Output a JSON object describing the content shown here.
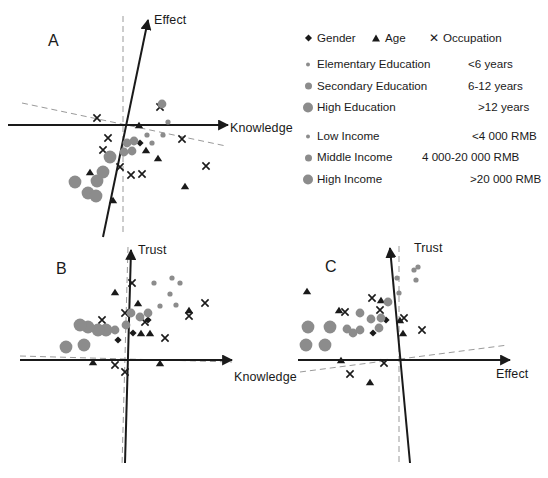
{
  "figure": {
    "type": "multi-panel-biplot",
    "panels": [
      "A",
      "B",
      "C"
    ]
  },
  "legend": {
    "rows": [
      {
        "marker": "diamond",
        "label": "Gender",
        "value": ""
      },
      {
        "marker": "triangle",
        "label": "Age",
        "value": ""
      },
      {
        "marker": "cross",
        "label": "Occupation",
        "value": ""
      },
      {
        "marker": "dot-s",
        "label": "Elementary Education",
        "value": "<6 years"
      },
      {
        "marker": "dot-m",
        "label": "Secondary Education",
        "value": "6-12 years"
      },
      {
        "marker": "dot-l",
        "label": "High Education",
        "value": ">12 years"
      },
      {
        "marker": "dot-s",
        "label": "Low Income",
        "value": "<4 000 RMB"
      },
      {
        "marker": "dot-m",
        "label": "Middle Income",
        "value": "4 000-20 000 RMB"
      },
      {
        "marker": "dot-l",
        "label": "High Income",
        "value": ">20 000 RMB"
      }
    ],
    "header_row": {
      "gender": "Gender",
      "age": "Age",
      "occupation": "Occupation"
    },
    "marker_color_circle": "#8c8c8c",
    "marker_color_dark": "#1a1a1a"
  },
  "panelA": {
    "letter": "A",
    "x_axis_label": "Knowledge",
    "y_axis_label": "Effect"
  },
  "panelB": {
    "letter": "B",
    "x_axis_label": "Knowledge",
    "y_axis_label": "Trust"
  },
  "panelC": {
    "letter": "C",
    "x_axis_label": "Effect",
    "y_axis_label": "Trust"
  },
  "chart_data": {
    "type": "scatter",
    "title": "",
    "grid": false,
    "legend_position": "top-right",
    "marker_types": [
      {
        "name": "Gender",
        "glyph": "diamond",
        "color": "#1a1a1a"
      },
      {
        "name": "Age",
        "glyph": "triangle",
        "color": "#1a1a1a"
      },
      {
        "name": "Occupation",
        "glyph": "cross",
        "color": "#1a1a1a"
      },
      {
        "name": "Elementary Education",
        "glyph": "small-circle",
        "color": "#8c8c8c"
      },
      {
        "name": "Secondary Education",
        "glyph": "medium-circle",
        "color": "#8c8c8c"
      },
      {
        "name": "High Education",
        "glyph": "large-circle",
        "color": "#8c8c8c"
      },
      {
        "name": "Low Income",
        "glyph": "small-circle",
        "color": "#8c8c8c"
      },
      {
        "name": "Middle Income",
        "glyph": "medium-circle",
        "color": "#8c8c8c"
      },
      {
        "name": "High Income",
        "glyph": "large-circle",
        "color": "#8c8c8c"
      }
    ],
    "panels": [
      {
        "panel": "A",
        "xlabel": "Knowledge",
        "ylabel": "Effect",
        "axes": {
          "x_solid": {
            "x1": 8,
            "y1": 125,
            "x2": 228,
            "y2": 125,
            "arrow": "right"
          },
          "y_solid": {
            "x1": 103,
            "y1": 237,
            "x2": 148,
            "y2": 20,
            "arrow": "up"
          },
          "x_dashed": {
            "x1": 22,
            "y1": 103,
            "x2": 226,
            "y2": 146
          },
          "y_dashed": {
            "x1": 123,
            "y1": 16,
            "x2": 123,
            "y2": 232
          }
        },
        "points": [
          {
            "type": "cross",
            "x": 97,
            "y": 118
          },
          {
            "type": "cross",
            "x": 108,
            "y": 138
          },
          {
            "type": "cross",
            "x": 103,
            "y": 150
          },
          {
            "type": "cross",
            "x": 120,
            "y": 167
          },
          {
            "type": "cross",
            "x": 131,
            "y": 175
          },
          {
            "type": "cross",
            "x": 142,
            "y": 174
          },
          {
            "type": "cross",
            "x": 160,
            "y": 107
          },
          {
            "type": "cross",
            "x": 182,
            "y": 139
          },
          {
            "type": "cross",
            "x": 206,
            "y": 166
          },
          {
            "type": "triangle",
            "x": 139,
            "y": 125
          },
          {
            "type": "triangle",
            "x": 146,
            "y": 150
          },
          {
            "type": "triangle",
            "x": 158,
            "y": 158
          },
          {
            "type": "triangle",
            "x": 90,
            "y": 172
          },
          {
            "type": "triangle",
            "x": 113,
            "y": 200
          },
          {
            "type": "triangle",
            "x": 185,
            "y": 186
          },
          {
            "type": "diamond",
            "x": 140,
            "y": 143
          },
          {
            "type": "small-circle",
            "x": 168,
            "y": 122
          },
          {
            "type": "small-circle",
            "x": 163,
            "y": 135
          },
          {
            "type": "small-circle",
            "x": 147,
            "y": 135
          },
          {
            "type": "small-circle",
            "x": 152,
            "y": 143
          },
          {
            "type": "medium-circle",
            "x": 162,
            "y": 104
          },
          {
            "type": "medium-circle",
            "x": 127,
            "y": 143
          },
          {
            "type": "medium-circle",
            "x": 134,
            "y": 141
          },
          {
            "type": "medium-circle",
            "x": 132,
            "y": 151
          },
          {
            "type": "medium-circle",
            "x": 124,
            "y": 152
          },
          {
            "type": "large-circle",
            "x": 110,
            "y": 157
          },
          {
            "type": "large-circle",
            "x": 103,
            "y": 172
          },
          {
            "type": "large-circle",
            "x": 75,
            "y": 182
          },
          {
            "type": "large-circle",
            "x": 97,
            "y": 181
          },
          {
            "type": "large-circle",
            "x": 88,
            "y": 193
          },
          {
            "type": "large-circle",
            "x": 96,
            "y": 196
          }
        ]
      },
      {
        "panel": "B",
        "xlabel": "Knowledge",
        "ylabel": "Trust",
        "axes": {
          "x_solid": {
            "x1": 20,
            "y1": 360,
            "x2": 232,
            "y2": 360,
            "arrow": "right"
          },
          "y_solid": {
            "x1": 125,
            "y1": 463,
            "x2": 131,
            "y2": 250,
            "arrow": "up"
          },
          "x_dashed": {
            "x1": 20,
            "y1": 356,
            "x2": 232,
            "y2": 362
          },
          "y_dashed": {
            "x1": 128,
            "y1": 247,
            "x2": 122,
            "y2": 466
          }
        },
        "points": [
          {
            "type": "cross",
            "x": 132,
            "y": 283
          },
          {
            "type": "cross",
            "x": 102,
            "y": 320
          },
          {
            "type": "cross",
            "x": 125,
            "y": 313
          },
          {
            "type": "cross",
            "x": 145,
            "y": 322
          },
          {
            "type": "cross",
            "x": 165,
            "y": 338
          },
          {
            "type": "cross",
            "x": 189,
            "y": 316
          },
          {
            "type": "cross",
            "x": 205,
            "y": 303
          },
          {
            "type": "cross",
            "x": 115,
            "y": 365
          },
          {
            "type": "cross",
            "x": 125,
            "y": 372
          },
          {
            "type": "triangle",
            "x": 115,
            "y": 292
          },
          {
            "type": "triangle",
            "x": 138,
            "y": 303
          },
          {
            "type": "triangle",
            "x": 141,
            "y": 333
          },
          {
            "type": "triangle",
            "x": 150,
            "y": 333
          },
          {
            "type": "triangle",
            "x": 189,
            "y": 310
          },
          {
            "type": "triangle",
            "x": 93,
            "y": 362
          },
          {
            "type": "triangle",
            "x": 160,
            "y": 363
          },
          {
            "type": "diamond",
            "x": 148,
            "y": 320
          },
          {
            "type": "diamond",
            "x": 133,
            "y": 333
          },
          {
            "type": "diamond",
            "x": 118,
            "y": 340
          },
          {
            "type": "small-circle",
            "x": 154,
            "y": 283
          },
          {
            "type": "small-circle",
            "x": 172,
            "y": 278
          },
          {
            "type": "small-circle",
            "x": 180,
            "y": 283
          },
          {
            "type": "small-circle",
            "x": 170,
            "y": 294
          },
          {
            "type": "small-circle",
            "x": 176,
            "y": 305
          },
          {
            "type": "small-circle",
            "x": 160,
            "y": 306
          },
          {
            "type": "medium-circle",
            "x": 148,
            "y": 313
          },
          {
            "type": "medium-circle",
            "x": 140,
            "y": 317
          },
          {
            "type": "medium-circle",
            "x": 131,
            "y": 313
          },
          {
            "type": "medium-circle",
            "x": 126,
            "y": 325
          },
          {
            "type": "medium-circle",
            "x": 115,
            "y": 330
          },
          {
            "type": "large-circle",
            "x": 106,
            "y": 330
          },
          {
            "type": "large-circle",
            "x": 98,
            "y": 330
          },
          {
            "type": "large-circle",
            "x": 88,
            "y": 327
          },
          {
            "type": "large-circle",
            "x": 80,
            "y": 325
          },
          {
            "type": "large-circle",
            "x": 84,
            "y": 345
          },
          {
            "type": "large-circle",
            "x": 66,
            "y": 347
          }
        ]
      },
      {
        "panel": "C",
        "xlabel": "Effect",
        "ylabel": "Trust",
        "axes": {
          "x_solid": {
            "x1": 298,
            "y1": 360,
            "x2": 510,
            "y2": 360,
            "arrow": "right"
          },
          "y_solid": {
            "x1": 410,
            "y1": 463,
            "x2": 390,
            "y2": 248,
            "arrow": "up"
          },
          "x_dashed": {
            "x1": 300,
            "y1": 372,
            "x2": 508,
            "y2": 345
          },
          "y_dashed": {
            "x1": 399,
            "y1": 246,
            "x2": 399,
            "y2": 466
          }
        },
        "points": [
          {
            "type": "cross",
            "x": 372,
            "y": 298
          },
          {
            "type": "cross",
            "x": 345,
            "y": 312
          },
          {
            "type": "cross",
            "x": 380,
            "y": 310
          },
          {
            "type": "cross",
            "x": 404,
            "y": 318
          },
          {
            "type": "cross",
            "x": 422,
            "y": 330
          },
          {
            "type": "cross",
            "x": 384,
            "y": 363
          },
          {
            "type": "cross",
            "x": 350,
            "y": 374
          },
          {
            "type": "triangle",
            "x": 307,
            "y": 291
          },
          {
            "type": "triangle",
            "x": 339,
            "y": 310
          },
          {
            "type": "triangle",
            "x": 381,
            "y": 300
          },
          {
            "type": "triangle",
            "x": 400,
            "y": 320
          },
          {
            "type": "triangle",
            "x": 403,
            "y": 333
          },
          {
            "type": "triangle",
            "x": 341,
            "y": 360
          },
          {
            "type": "triangle",
            "x": 370,
            "y": 382
          },
          {
            "type": "diamond",
            "x": 386,
            "y": 320
          },
          {
            "type": "diamond",
            "x": 373,
            "y": 333
          },
          {
            "type": "small-circle",
            "x": 414,
            "y": 270
          },
          {
            "type": "small-circle",
            "x": 418,
            "y": 267
          },
          {
            "type": "small-circle",
            "x": 416,
            "y": 280
          },
          {
            "type": "small-circle",
            "x": 397,
            "y": 278
          },
          {
            "type": "small-circle",
            "x": 399,
            "y": 293
          },
          {
            "type": "medium-circle",
            "x": 388,
            "y": 302
          },
          {
            "type": "medium-circle",
            "x": 381,
            "y": 318
          },
          {
            "type": "medium-circle",
            "x": 371,
            "y": 319
          },
          {
            "type": "medium-circle",
            "x": 379,
            "y": 328
          },
          {
            "type": "medium-circle",
            "x": 360,
            "y": 330
          },
          {
            "type": "medium-circle",
            "x": 353,
            "y": 333
          },
          {
            "type": "medium-circle",
            "x": 347,
            "y": 329
          },
          {
            "type": "medium-circle",
            "x": 360,
            "y": 313
          },
          {
            "type": "large-circle",
            "x": 308,
            "y": 327
          },
          {
            "type": "large-circle",
            "x": 330,
            "y": 327
          },
          {
            "type": "large-circle",
            "x": 306,
            "y": 345
          },
          {
            "type": "large-circle",
            "x": 325,
            "y": 345
          }
        ]
      }
    ]
  }
}
